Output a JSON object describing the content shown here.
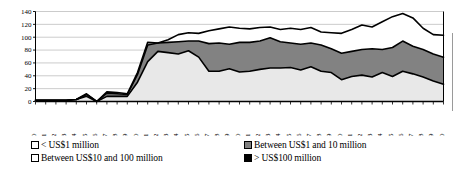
{
  "chart_data": {
    "type": "area",
    "stacked": true,
    "title": "",
    "subtitle": "",
    "xlabel": "",
    "ylabel": "",
    "ylim": [
      0,
      140
    ],
    "ytick_step": 20,
    "yticks": [
      0,
      20,
      40,
      60,
      80,
      100,
      120,
      140
    ],
    "grid": true,
    "legend_position": "bottom",
    "x": [
      1960,
      1961,
      1962,
      1963,
      1964,
      1965,
      1966,
      1967,
      1968,
      1969,
      1970,
      1971,
      1972,
      1973,
      1974,
      1975,
      1976,
      1977,
      1978,
      1979,
      1980,
      1981,
      1982,
      1983,
      1984,
      1985,
      1986,
      1987,
      1988,
      1989,
      1990,
      1991,
      1992,
      1993,
      1994,
      1995,
      1996,
      1997,
      1998,
      1999,
      2000
    ],
    "xtick_labels": [
      "1960",
      "1961",
      "1962",
      "1963",
      "1964",
      "1965",
      "1966",
      "1967",
      "1968",
      "1969",
      "1970",
      "1971",
      "1972",
      "1973",
      "1974",
      "1975",
      "1976",
      "1977",
      "1978",
      "1979",
      "1980",
      "1981",
      "1982",
      "1983",
      "1984",
      "1985",
      "1986",
      "1987",
      "1988",
      "1989",
      "1990",
      "1991",
      "1992",
      "1993",
      "1994",
      "1995",
      "1996",
      "1997",
      "1998",
      "1999",
      "2000"
    ],
    "xtick_rotation": 90,
    "series": [
      {
        "name": "< US$1 million",
        "fill": "#e8e8e8",
        "values": [
          2,
          2,
          2,
          2,
          3,
          8,
          0,
          8,
          8,
          8,
          30,
          62,
          78,
          76,
          74,
          79,
          69,
          47,
          47,
          51,
          46,
          47,
          50,
          52,
          52,
          53,
          49,
          54,
          47,
          45,
          34,
          39,
          41,
          38,
          45,
          39,
          47,
          43,
          38,
          32,
          27
        ]
      },
      {
        "name": "Between US$1 and 10 million",
        "fill": "#828282",
        "values": [
          0,
          0,
          0,
          0,
          0,
          3,
          0,
          5,
          4,
          3,
          12,
          26,
          13,
          16,
          19,
          15,
          25,
          43,
          44,
          38,
          46,
          45,
          44,
          47,
          41,
          38,
          40,
          37,
          41,
          37,
          41,
          39,
          40,
          44,
          36,
          45,
          47,
          43,
          43,
          42,
          42
        ]
      },
      {
        "name": "Between US$10 and 100 million",
        "fill": "#ffffff",
        "values": [
          0,
          0,
          0,
          0,
          0,
          1,
          0,
          2,
          2,
          1,
          3,
          4,
          0,
          4,
          11,
          13,
          12,
          20,
          22,
          27,
          22,
          21,
          21,
          17,
          19,
          23,
          23,
          24,
          20,
          25,
          31,
          34,
          38,
          34,
          43,
          48,
          43,
          44,
          33,
          30,
          34
        ]
      },
      {
        "name": "> US$100 million",
        "fill": "#000000",
        "values": [
          0,
          0,
          0,
          0,
          0,
          0,
          0,
          0,
          0,
          0,
          0,
          0,
          0,
          0,
          0,
          0,
          0,
          0,
          0,
          0,
          0,
          0,
          0,
          0,
          0,
          0,
          0,
          0,
          0,
          0,
          0,
          0,
          0,
          0,
          0,
          0,
          0,
          0,
          0,
          0,
          0
        ]
      }
    ],
    "totals": [
      2,
      2,
      2,
      2,
      3,
      12,
      0,
      15,
      14,
      12,
      45,
      92,
      91,
      96,
      104,
      107,
      106,
      110,
      113,
      116,
      114,
      113,
      115,
      116,
      112,
      114,
      112,
      115,
      108,
      107,
      106,
      112,
      119,
      116,
      124,
      132,
      137,
      130,
      114,
      104,
      103
    ]
  },
  "legend": {
    "columns": [
      {
        "entries": [
          {
            "label": "< US$1 million",
            "swatch": "white"
          },
          {
            "label": "Between US$10 and 100 million",
            "swatch": "white"
          }
        ]
      },
      {
        "entries": [
          {
            "label": "Between US$1 and 10 million",
            "swatch": "gray"
          },
          {
            "label": "> US$100 million",
            "swatch": "black"
          }
        ]
      }
    ]
  },
  "colors": {
    "band_lt1m": "#e8e8e8",
    "band_1to10m": "#828282",
    "band_10to100m": "#ffffff",
    "band_gt100m": "#000000",
    "gridline": "#b5b5b5",
    "axis": "#000000",
    "outline": "#000000"
  }
}
